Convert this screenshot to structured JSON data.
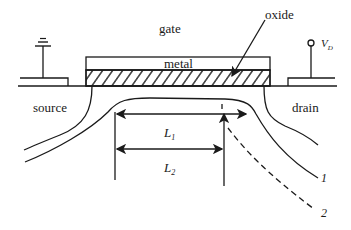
{
  "diagram": {
    "type": "MOSFET cross-section with channel pinch-off",
    "labels": {
      "gate": "gate",
      "metal": "metal",
      "oxide": "oxide",
      "source": "source",
      "drain": "drain",
      "drain_voltage": "V",
      "drain_voltage_sub": "D",
      "length1": "L",
      "length1_sub": "1",
      "length2": "L",
      "length2_sub": "2",
      "curve1": "1",
      "curve2": "2"
    },
    "colors": {
      "stroke": "#1a1a1a",
      "background": "#ffffff"
    },
    "icons": {
      "source_terminal": "ground-icon",
      "drain_terminal": "terminal-circle-icon"
    }
  }
}
